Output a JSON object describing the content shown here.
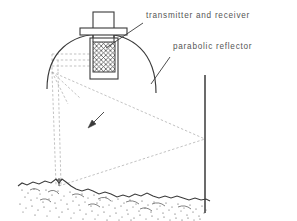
{
  "figure": {
    "type": "technical-line-diagram",
    "background_color": "#ffffff",
    "ink_color": "#3a3a3a",
    "ray_color": "#9a9a9a",
    "text_color": "#555555"
  },
  "labels": {
    "transmitter": "transmitter and receiver",
    "reflector": "parabolic reflector"
  },
  "parts": {
    "housing_name": "transmitter-receiver-housing",
    "flange_name": "mounting-flange",
    "mesh_name": "feed-mesh-element",
    "reflector_name": "parabolic-reflector-arc",
    "wall_name": "vertical-reference-wall",
    "ground_name": "rough-ground-terrain",
    "marker_name": "ground-stake-marker",
    "arrow_name": "direction-arrow"
  },
  "geometry": {
    "housing": {
      "x": 93,
      "y": 12,
      "width": 21,
      "height": 27
    },
    "flange": {
      "x": 80,
      "y": 28,
      "width": 47,
      "height": 7
    },
    "mesh": {
      "x": 93,
      "y": 42,
      "width": 22,
      "height": 30
    },
    "casing": {
      "x": 90,
      "y": 38,
      "width": 28,
      "height": 41
    },
    "reflector_arc": {
      "left_x": 47,
      "left_y": 89,
      "apex_x": 102,
      "apex_y": 34,
      "right_x": 156,
      "right_y": 93
    },
    "focal_point": {
      "x": 52,
      "y": 72
    },
    "wall": {
      "x": 205,
      "y_top": 75,
      "y_bottom": 213
    },
    "wall_hit": {
      "x": 205,
      "y": 139
    },
    "ground_contact": {
      "x": 59,
      "y": 186
    },
    "arrow": {
      "x1": 104,
      "y1": 112,
      "x2": 88,
      "y2": 128
    }
  }
}
